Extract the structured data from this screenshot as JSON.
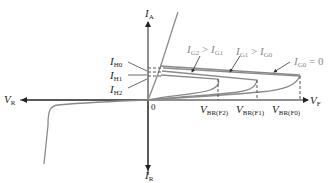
{
  "axes": {
    "y_pos": {
      "symbol": "I",
      "sub": "A"
    },
    "y_neg": {
      "symbol": "I",
      "sub": "R"
    },
    "x_pos": {
      "symbol": "V",
      "sub": "F"
    },
    "x_neg": {
      "symbol": "V",
      "sub": "R"
    },
    "origin": "0"
  },
  "holding_currents": [
    {
      "symbol": "I",
      "sub": "H0"
    },
    {
      "symbol": "I",
      "sub": "H1"
    },
    {
      "symbol": "I",
      "sub": "H2"
    }
  ],
  "breakover_voltages": [
    {
      "symbol": "V",
      "sub": "BR(F2)"
    },
    {
      "symbol": "V",
      "sub": "BR(F1)"
    },
    {
      "symbol": "V",
      "sub": "BR(F0)"
    }
  ],
  "gate_annotations": [
    {
      "a": "I",
      "a_sub": "G2",
      "op": " > ",
      "b": "I",
      "b_sub": "G1"
    },
    {
      "a": "I",
      "a_sub": "G1",
      "op": " > ",
      "b": "I",
      "b_sub": "G0"
    },
    {
      "a": "I",
      "a_sub": "G0",
      "op": " = ",
      "b": "0",
      "b_sub": ""
    }
  ],
  "colors": {
    "axis": "#222222",
    "curve": "#8a8a8a",
    "dashed": "#555555"
  }
}
